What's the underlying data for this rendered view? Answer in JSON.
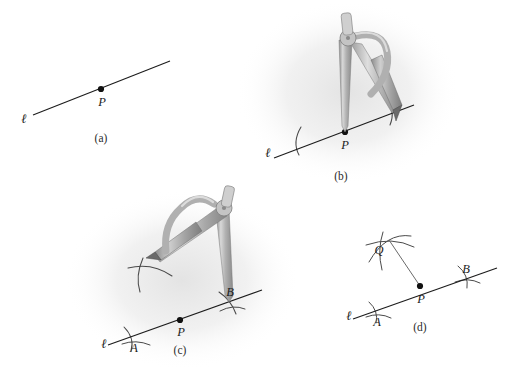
{
  "figure": {
    "background_color": "#ffffff",
    "ink_color": "#1c1c1c",
    "arc_color": "#555555",
    "metal_color": "#b9b9b9",
    "halo_color": "#e8e8e8"
  },
  "panels": [
    {
      "id": "a",
      "caption": "(a)",
      "caption_pos": {
        "x": 101,
        "y": 138
      },
      "line_label": "ℓ",
      "line_label_pos": {
        "x": 24,
        "y": 119
      },
      "line": {
        "x1": 33,
        "y1": 115,
        "x2": 170,
        "y2": 61
      },
      "points": [
        {
          "label": "P",
          "x": 101,
          "y": 89,
          "label_x": 102,
          "label_y": 102
        }
      ],
      "arcs": [],
      "tool": null
    },
    {
      "id": "b",
      "caption": "(b)",
      "caption_pos": {
        "x": 341,
        "y": 176
      },
      "line_label": "ℓ",
      "line_label_pos": {
        "x": 268,
        "y": 153
      },
      "line": {
        "x1": 274,
        "y1": 158,
        "x2": 414,
        "y2": 105
      },
      "points": [
        {
          "label": "P",
          "x": 345,
          "y": 132,
          "label_x": 345,
          "label_y": 145
        }
      ],
      "arcs": [
        {
          "name": "arc-left-A",
          "cx": 345,
          "cy": 132,
          "r": 50,
          "a0": 158,
          "a1": 202
        },
        {
          "name": "arc-right-B",
          "cx": 345,
          "cy": 132,
          "r": 50,
          "a0": -22,
          "a1": 22
        }
      ],
      "tool": {
        "type": "compass",
        "pivot": {
          "x": 345,
          "y": 132
        },
        "pencil": {
          "x": 394,
          "y": 113
        },
        "head": {
          "x": 347,
          "y": 36
        },
        "rotation_deg": 0
      }
    },
    {
      "id": "c",
      "caption": "(c)",
      "caption_pos": {
        "x": 180,
        "y": 350
      },
      "line_label": "ℓ",
      "line_label_pos": {
        "x": 104,
        "y": 344
      },
      "line": {
        "x1": 108,
        "y1": 345,
        "x2": 262,
        "y2": 290
      },
      "points": [
        {
          "label": "A",
          "x": 133,
          "y": 336,
          "label_x": 134,
          "label_y": 348
        },
        {
          "label": "P",
          "x": 180,
          "y": 320,
          "label_x": 181,
          "label_y": 332
        },
        {
          "label": "B",
          "x": 229,
          "y": 302,
          "label_x": 230,
          "label_y": 292
        }
      ],
      "arcs": [
        {
          "name": "arc-at-A",
          "cx": 180,
          "cy": 320,
          "r": 49,
          "a0": 160,
          "a1": 200
        },
        {
          "name": "arc-at-B",
          "cx": 180,
          "cy": 320,
          "r": 50,
          "a0": -20,
          "a1": 20
        },
        {
          "name": "arc-from-B-upper",
          "cx": 229,
          "cy": 302,
          "r": 99,
          "a0": 168,
          "a1": 212
        }
      ],
      "tool": {
        "type": "compass",
        "pivot": {
          "x": 229,
          "y": 302
        },
        "pencil": {
          "x": 152,
          "y": 254
        },
        "head": {
          "x": 222,
          "y": 205
        },
        "rotation_deg": -38
      }
    },
    {
      "id": "d",
      "caption": "(d)",
      "caption_pos": {
        "x": 420,
        "y": 327
      },
      "line_label": "ℓ",
      "line_label_pos": {
        "x": 349,
        "y": 316
      },
      "line": {
        "x1": 353,
        "y1": 319,
        "x2": 497,
        "y2": 268
      },
      "points": [
        {
          "label": "A",
          "x": 376,
          "y": 311,
          "label_x": 377,
          "label_y": 322
        },
        {
          "label": "P",
          "x": 420,
          "y": 286,
          "label_x": 421,
          "label_y": 299
        },
        {
          "label": "B",
          "x": 465,
          "y": 279,
          "label_x": 466,
          "label_y": 269
        },
        {
          "label": "Q",
          "x": 390,
          "y": 241,
          "label_x": 379,
          "label_y": 250
        }
      ],
      "arcs": [
        {
          "name": "arc-at-A",
          "cx": 420,
          "cy": 286,
          "r": 46,
          "a0": 160,
          "a1": 202
        },
        {
          "name": "arc-at-B",
          "cx": 420,
          "cy": 286,
          "r": 47,
          "a0": -22,
          "a1": 20
        },
        {
          "name": "arc-from-A-to-Q",
          "cx": 376,
          "cy": 311,
          "r": 74,
          "a0": 240,
          "a1": 300
        },
        {
          "name": "arc-from-B-to-Q",
          "cx": 465,
          "cy": 279,
          "r": 84,
          "a0": 206,
          "a1": 262
        }
      ],
      "segment_pq": {
        "x1": 420,
        "y1": 286,
        "x2": 390,
        "y2": 241
      },
      "tool": null
    }
  ],
  "legend_notes": {
    "step_a": "Given line and point P on it",
    "step_b": "Compass at P marks equal distances both ways",
    "step_c": "Wider compass at B sweeps an arc above the line",
    "step_d": "Arcs meet at Q; PQ is perpendicular to the line"
  }
}
